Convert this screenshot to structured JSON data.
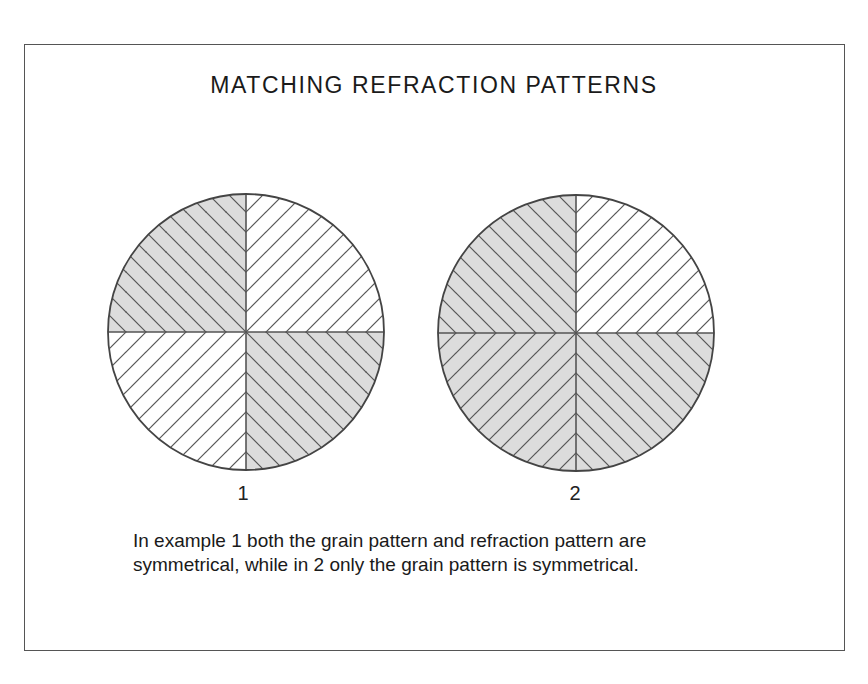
{
  "title": "MATCHING REFRACTION PATTERNS",
  "figures": [
    {
      "label": "1",
      "quadrants": {
        "top_left": {
          "fill": "gray",
          "hatch": "backslash"
        },
        "top_right": {
          "fill": "white",
          "hatch": "slash"
        },
        "bottom_left": {
          "fill": "white",
          "hatch": "slash"
        },
        "bottom_right": {
          "fill": "gray",
          "hatch": "backslash"
        }
      }
    },
    {
      "label": "2",
      "quadrants": {
        "top_left": {
          "fill": "gray",
          "hatch": "backslash"
        },
        "top_right": {
          "fill": "white",
          "hatch": "slash"
        },
        "bottom_left": {
          "fill": "gray",
          "hatch": "slash"
        },
        "bottom_right": {
          "fill": "gray",
          "hatch": "backslash"
        }
      }
    }
  ],
  "caption": "In example 1 both the grain pattern and refraction pattern are symmetrical, while in 2 only the grain pattern is symmetrical.",
  "colors": {
    "gray_fill": "#dcdcdc",
    "line": "#555555",
    "border": "#555555"
  }
}
